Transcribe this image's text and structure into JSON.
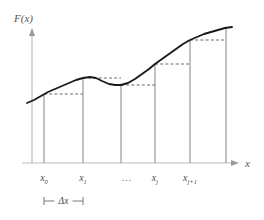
{
  "figure": {
    "title_visible": false,
    "background_color": "#ffffff",
    "axis_color": "#bdbdbd",
    "bar_color": "#8e8e8e",
    "curve_color": "#1a1a1a",
    "dashed_color": "#6b6b6b",
    "text_color": "#4a4a4a"
  },
  "axes": {
    "y_axis_label": "F(x)",
    "x_axis_label": "x",
    "y_axis_arrow": "arrow-up-icon",
    "x_axis_arrow": "arrow-right-icon",
    "origin_px": {
      "x": 32,
      "y": 163
    },
    "x_axis_end_px": 237,
    "y_axis_top_px": 30
  },
  "ticks": [
    {
      "id": "x0",
      "base": "x",
      "sub": "0",
      "x_px": 44
    },
    {
      "id": "x1",
      "base": "x",
      "sub": "1",
      "x_px": 83
    },
    {
      "id": "xj",
      "base": "x",
      "sub": "j",
      "x_px": 155
    },
    {
      "id": "xj1",
      "base": "x",
      "sub": "j+1",
      "x_px": 190
    }
  ],
  "ellipsis": {
    "text": "...",
    "x_px": 127
  },
  "delta": {
    "label": "Δx",
    "start_px": 44,
    "end_px": 83,
    "y_px": 201,
    "cap_half_height": 4
  },
  "chart_data": {
    "type": "line",
    "title": "",
    "xlabel": "x",
    "ylabel": "F(x)",
    "grid": false,
    "legend": null,
    "annotations": [
      "x_0",
      "x_1",
      "...",
      "x_j",
      "x_{j+1}",
      "Δx"
    ],
    "curve": {
      "name": "F(x)",
      "color": "#1a1a1a",
      "points_px": [
        [
          27,
          103
        ],
        [
          34,
          100
        ],
        [
          41,
          96
        ],
        [
          48,
          92
        ],
        [
          55,
          89
        ],
        [
          62,
          86
        ],
        [
          69,
          83
        ],
        [
          76,
          80
        ],
        [
          83,
          78
        ],
        [
          90,
          77
        ],
        [
          96,
          78
        ],
        [
          102,
          81
        ],
        [
          109,
          84
        ],
        [
          115,
          85
        ],
        [
          121,
          85
        ],
        [
          128,
          83
        ],
        [
          135,
          79
        ],
        [
          142,
          74
        ],
        [
          149,
          69
        ],
        [
          155,
          64
        ],
        [
          162,
          59
        ],
        [
          169,
          54
        ],
        [
          176,
          49
        ],
        [
          183,
          44
        ],
        [
          190,
          40
        ],
        [
          197,
          37
        ],
        [
          204,
          34
        ],
        [
          211,
          32
        ],
        [
          218,
          30
        ],
        [
          225,
          28
        ],
        [
          232,
          27
        ]
      ]
    },
    "bars": [
      {
        "index": 0,
        "x_px": 44,
        "top_px": 94,
        "bottom_px": 163
      },
      {
        "index": 1,
        "x_px": 83,
        "top_px": 78,
        "bottom_px": 163
      },
      {
        "index": 2,
        "x_px": 121,
        "top_px": 85,
        "bottom_px": 163
      },
      {
        "index": 3,
        "x_px": 155,
        "top_px": 64,
        "bottom_px": 163
      },
      {
        "index": 4,
        "x_px": 190,
        "top_px": 40,
        "bottom_px": 163
      },
      {
        "index": 5,
        "x_px": 226,
        "top_px": 28,
        "bottom_px": 163
      }
    ],
    "step_tops": [
      {
        "index": 0,
        "y_px": 94,
        "x_start_px": 44,
        "x_end_px": 83
      },
      {
        "index": 1,
        "y_px": 78,
        "x_start_px": 83,
        "x_end_px": 121
      },
      {
        "index": 2,
        "y_px": 85,
        "x_start_px": 121,
        "x_end_px": 155
      },
      {
        "index": 3,
        "y_px": 64,
        "x_start_px": 155,
        "x_end_px": 190
      },
      {
        "index": 4,
        "y_px": 40,
        "x_start_px": 190,
        "x_end_px": 226
      }
    ]
  }
}
